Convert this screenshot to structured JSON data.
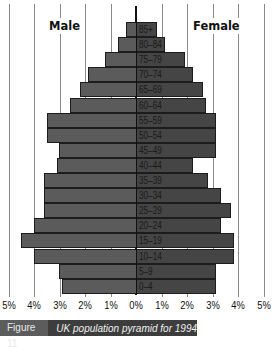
{
  "chart_data": {
    "type": "bar",
    "orientation": "horizontal",
    "subtype": "population-pyramid",
    "title": "UK population pyramid for 1994",
    "figure_label": "Figure 11",
    "xlabel": "",
    "ylabel": "",
    "x_ticks": [
      "5%",
      "4%",
      "3%",
      "2%",
      "1%",
      "0%",
      "1%",
      "2%",
      "3%",
      "4%",
      "5%"
    ],
    "xlim": [
      -5,
      5
    ],
    "grid": true,
    "categories": [
      "85+",
      "80–84",
      "75–79",
      "70–74",
      "65–69",
      "60–64",
      "55–59",
      "50–54",
      "45–49",
      "40–44",
      "35–39",
      "30–34",
      "25–29",
      "20–24",
      "15–19",
      "10–14",
      "5–9",
      "0–4"
    ],
    "series": [
      {
        "name": "Male",
        "side": "left",
        "color": "#5b5b5b",
        "values": [
          0.4,
          0.7,
          1.2,
          1.9,
          2.2,
          2.6,
          3.5,
          3.5,
          3.0,
          3.1,
          3.6,
          3.6,
          3.6,
          4.0,
          4.5,
          4.0,
          3.0,
          2.9
        ]
      },
      {
        "name": "Female",
        "side": "right",
        "color": "#454545",
        "values": [
          0.8,
          1.1,
          1.9,
          2.2,
          2.6,
          2.7,
          3.1,
          3.1,
          3.1,
          2.2,
          2.8,
          3.3,
          3.7,
          3.3,
          3.8,
          3.8,
          3.1,
          3.1
        ]
      }
    ],
    "legend": [
      "Male",
      "Female"
    ]
  },
  "labels": {
    "male": "Male",
    "female": "Female"
  },
  "caption": {
    "figure": "Figure 11",
    "text": "UK population pyramid for 1994"
  }
}
